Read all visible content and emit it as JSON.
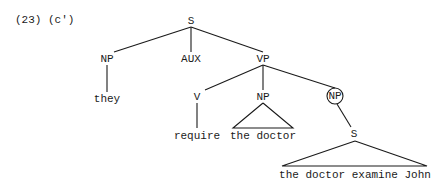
{
  "caption": "(23) (c')",
  "nodes": {
    "s_root": "S",
    "np_subj": "NP",
    "aux": "AUX",
    "vp": "VP",
    "np_subj_leaf": "they",
    "v": "V",
    "v_leaf": "require",
    "np_obj": "NP",
    "np_obj_leaf": "the doctor",
    "np_circled": "NP",
    "s_embedded": "S",
    "s_embedded_leaf": "the doctor examine John"
  },
  "annotations": {
    "circled_node": "np_circled"
  }
}
